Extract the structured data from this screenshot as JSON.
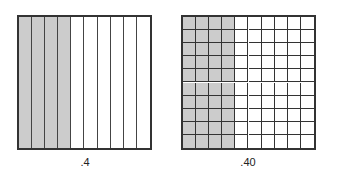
{
  "diagram": {
    "shade_color": "#cccccc",
    "line_color": "#333333",
    "models": [
      {
        "name": "tenths-model",
        "divisions": "columns",
        "columns": 10,
        "rows": 1,
        "shaded_columns": 4,
        "label": ".4"
      },
      {
        "name": "hundredths-model",
        "divisions": "grid",
        "columns": 10,
        "rows": 10,
        "shaded_columns": 4,
        "label": ".40"
      }
    ]
  }
}
